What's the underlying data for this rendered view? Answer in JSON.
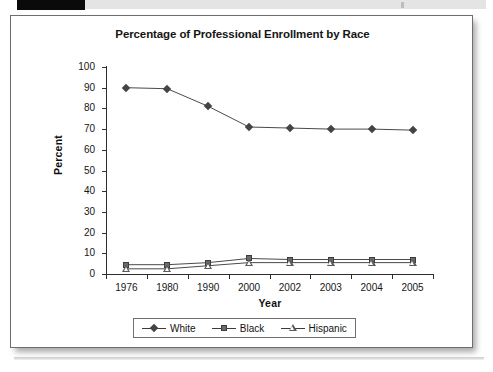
{
  "page": {
    "scan_artifacts": {
      "black_bar": "black-bar",
      "gray_bar": "gray-bar"
    }
  },
  "chart_data": {
    "type": "line",
    "title": "Percentage of Professional Enrollment by Race",
    "xlabel": "Year",
    "ylabel": "Percent",
    "categories": [
      "1976",
      "1980",
      "1990",
      "2000",
      "2002",
      "2003",
      "2004",
      "2005"
    ],
    "ylim": [
      0,
      100
    ],
    "yticks": [
      0,
      10,
      20,
      30,
      40,
      50,
      60,
      70,
      80,
      90,
      100
    ],
    "ytick_labels": [
      "0",
      "10",
      "20",
      "30",
      "40",
      "50",
      "60",
      "70",
      "80",
      "90",
      "100"
    ],
    "grid": false,
    "legend_position": "bottom",
    "series": [
      {
        "name": "White",
        "marker": "diamond-filled",
        "color": "#444444",
        "values": [
          90,
          89.5,
          81,
          71,
          70.5,
          70,
          70,
          69.5
        ]
      },
      {
        "name": "Black",
        "marker": "square-filled",
        "color": "#6b6b6b",
        "values": [
          4.5,
          4.5,
          5.5,
          7.5,
          7,
          7,
          7,
          7
        ]
      },
      {
        "name": "Hispanic",
        "marker": "triangle-open",
        "color": "#5a5a5a",
        "values": [
          2.5,
          2.5,
          4,
          5.5,
          5.5,
          5.5,
          5.5,
          5.5
        ]
      }
    ]
  },
  "legend": {
    "items": [
      {
        "label": "White"
      },
      {
        "label": "Black"
      },
      {
        "label": "Hispanic"
      }
    ]
  }
}
